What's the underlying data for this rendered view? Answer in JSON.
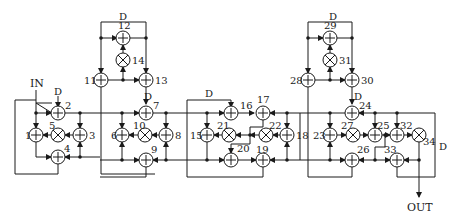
{
  "diagram": {
    "type": "signal-flow-graph",
    "input_label": "IN",
    "output_label": "OUT",
    "delay_label": "D",
    "adders": [
      "1",
      "2",
      "3",
      "4",
      "6",
      "7",
      "8",
      "9",
      "11",
      "12",
      "13",
      "15",
      "16",
      "17",
      "18",
      "19",
      "20",
      "23",
      "24",
      "25",
      "26",
      "28",
      "29",
      "30",
      "32",
      "33"
    ],
    "multipliers": [
      "5",
      "10",
      "14",
      "21",
      "22",
      "27",
      "31",
      "34"
    ],
    "sections": [
      {
        "name": "section-1",
        "nodes": [
          "1",
          "2",
          "3",
          "4",
          "5"
        ]
      },
      {
        "name": "section-2",
        "nodes": [
          "6",
          "7",
          "8",
          "9",
          "10"
        ]
      },
      {
        "name": "section-2-upper",
        "nodes": [
          "11",
          "12",
          "13",
          "14"
        ]
      },
      {
        "name": "section-3",
        "nodes": [
          "15",
          "16",
          "17",
          "18",
          "19",
          "20",
          "21",
          "22"
        ]
      },
      {
        "name": "section-4",
        "nodes": [
          "23",
          "24",
          "25",
          "26",
          "27"
        ]
      },
      {
        "name": "section-4-upper",
        "nodes": [
          "28",
          "29",
          "30",
          "31"
        ]
      },
      {
        "name": "section-5",
        "nodes": [
          "32",
          "33",
          "34"
        ]
      }
    ]
  },
  "labels": {
    "in": "IN",
    "out": "OUT",
    "d": "D",
    "n1": "1",
    "n2": "2",
    "n3": "3",
    "n4": "4",
    "n5": "5",
    "n6": "6",
    "n7": "7",
    "n8": "8",
    "n9": "9",
    "n10": "10",
    "n11": "11",
    "n12": "12",
    "n13": "13",
    "n14": "14",
    "n15": "15",
    "n16": "16",
    "n17": "17",
    "n18": "18",
    "n19": "19",
    "n20": "20",
    "n21": "21",
    "n22": "22",
    "n23": "23",
    "n24": "24",
    "n25": "25",
    "n26": "26",
    "n27": "27",
    "n28": "28",
    "n29": "29",
    "n30": "30",
    "n31": "31",
    "n32": "32",
    "n33": "33",
    "n34": "34"
  }
}
